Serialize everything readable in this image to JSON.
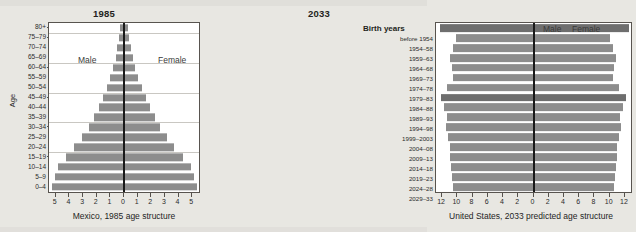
{
  "chart_data": [
    {
      "id": "mexico_1985",
      "type": "bar",
      "orientation": "population-pyramid",
      "title": "1985",
      "caption": "Mexico, 1985 age structure",
      "xlabel": "",
      "ylabel": "Age",
      "left_series_label": "Male",
      "right_series_label": "Female",
      "xlim": [
        -5.5,
        5.5
      ],
      "xticks": [
        "5",
        "4",
        "3",
        "2",
        "1",
        "0",
        "1",
        "2",
        "3",
        "4",
        "5"
      ],
      "xtick_values": [
        -5,
        -4,
        -3,
        -2,
        -1,
        0,
        1,
        2,
        3,
        4,
        5
      ],
      "grid": true,
      "categories": [
        "80+",
        "75–79",
        "70–74",
        "65–69",
        "60–64",
        "55–59",
        "50–54",
        "45–49",
        "40–44",
        "35–39",
        "30–34",
        "25–29",
        "20–24",
        "15–19",
        "10–14",
        "5–9",
        "0–4"
      ],
      "series": [
        {
          "name": "Male",
          "values": [
            0.3,
            0.35,
            0.48,
            0.62,
            0.8,
            1.0,
            1.25,
            1.55,
            1.85,
            2.2,
            2.6,
            3.1,
            3.65,
            4.25,
            4.85,
            5.05,
            5.3
          ]
        },
        {
          "name": "Female",
          "values": [
            0.32,
            0.38,
            0.52,
            0.66,
            0.84,
            1.05,
            1.3,
            1.6,
            1.9,
            2.25,
            2.65,
            3.15,
            3.7,
            4.3,
            4.9,
            5.1,
            5.35
          ]
        }
      ],
      "gridline_categories": [
        "75–79",
        "60–64",
        "45–49",
        "30–34",
        "15–19"
      ]
    },
    {
      "id": "united_states_2033",
      "type": "bar",
      "orientation": "population-pyramid",
      "title": "2033",
      "caption": "United States, 2033 predicted age structure",
      "xlabel": "",
      "ylabel": "Birth years",
      "left_series_label": "Male",
      "right_series_label": "Female",
      "xlim": [
        -12.8,
        12.8
      ],
      "xticks": [
        "12",
        "10",
        "8",
        "6",
        "4",
        "2",
        "0",
        "2",
        "4",
        "6",
        "8",
        "10",
        "12"
      ],
      "xtick_values": [
        -12,
        -10,
        -8,
        -6,
        -4,
        -2,
        0,
        2,
        4,
        6,
        8,
        10,
        12
      ],
      "grid": true,
      "categories": [
        "before 1954",
        "1954–58",
        "1959–63",
        "1964–68",
        "1969–73",
        "1974–78",
        "1979–83",
        "1984–88",
        "1989–93",
        "1994–98",
        "1999–2003",
        "2004–08",
        "2009–13",
        "2014–18",
        "2019–23",
        "2024–28",
        "2029–33"
      ],
      "series": [
        {
          "name": "Male",
          "values": [
            12.3,
            10.2,
            10.6,
            10.9,
            10.7,
            10.6,
            11.3,
            12.2,
            11.7,
            11.4,
            11.5,
            11.2,
            11.0,
            10.9,
            10.8,
            10.7,
            10.6
          ]
        },
        {
          "name": "Female",
          "values": [
            12.6,
            10.0,
            10.5,
            10.8,
            10.6,
            10.5,
            11.2,
            12.1,
            11.8,
            11.4,
            11.5,
            11.2,
            11.0,
            10.9,
            10.8,
            10.7,
            10.6
          ]
        }
      ],
      "highlight_categories": [
        "before 1954",
        "1984–88"
      ]
    }
  ],
  "left_panel": {
    "title": "1985",
    "axis_title": "Age",
    "male_label": "Male",
    "female_label": "Female",
    "caption": "Mexico, 1985 age structure"
  },
  "right_panel": {
    "title": "2033",
    "axis_title": "Birth years",
    "male_label": "Male",
    "female_label": "Female",
    "caption": "United States, 2033 predicted age structure"
  },
  "colors": {
    "bar": "#8d8d8d",
    "bar_highlight": "#6e6e6e",
    "axis": "#1a1a1a",
    "grid": "#c9c7c2",
    "page_background": "#e8e7e2",
    "plot_background": "#ffffff",
    "text": "#231f20"
  }
}
